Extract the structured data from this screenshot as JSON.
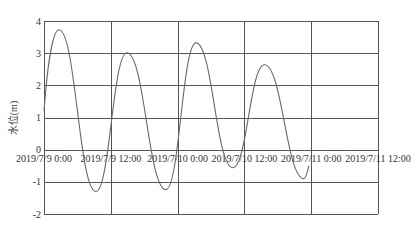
{
  "chart_data": {
    "type": "line",
    "title": "",
    "xlabel": "",
    "ylabel": "水位(m)",
    "ylim": [
      -2,
      4
    ],
    "yticks": [
      4,
      3,
      2,
      1,
      0,
      -1,
      -2
    ],
    "ytick_labels": [
      "4",
      "3",
      "2",
      "1",
      "0",
      "-1",
      "-2"
    ],
    "xlim_hours": [
      0,
      60
    ],
    "xticks_hours": [
      0,
      12,
      24,
      36,
      48,
      60
    ],
    "xtick_labels": [
      "2019/7/9 0:00",
      "2019/7/9 12:00",
      "2019/7/10 0:00",
      "2019/7/10 12:00",
      "2019/7/11 0:00",
      "2019/7/11 12:00"
    ],
    "grid": true,
    "legend": null,
    "series": [
      {
        "name": "水位",
        "color": "#6a6a6a",
        "x_hours": [
          0,
          2.7,
          9.3,
          14.9,
          21.9,
          27.3,
          33.9,
          39.6,
          46.7,
          47.6
        ],
        "values": [
          1.2,
          3.73,
          -1.3,
          3.01,
          -1.24,
          3.32,
          -0.56,
          2.64,
          -0.9,
          -0.5
        ]
      }
    ]
  },
  "layout": {
    "plot_left": 44,
    "plot_right": 378,
    "plot_top": 21,
    "plot_bottom": 214,
    "zero_y": 149
  }
}
